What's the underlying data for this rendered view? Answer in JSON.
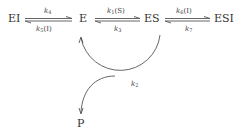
{
  "diagram": {
    "type": "enzyme kinetic scheme",
    "species": {
      "ei": "EI",
      "e": "E",
      "es": "ES",
      "esi": "ESI",
      "p": "P"
    },
    "rates": {
      "ei_e_forward": {
        "k": "k",
        "sub": "4",
        "arg": ""
      },
      "ei_e_reverse": {
        "k": "k",
        "sub": "5",
        "arg": "(I)"
      },
      "e_es_forward": {
        "k": "k",
        "sub": "1",
        "arg": "(S)"
      },
      "e_es_reverse": {
        "k": "k",
        "sub": "3",
        "arg": ""
      },
      "es_esi_forward": {
        "k": "k",
        "sub": "6",
        "arg": "(I)"
      },
      "es_esi_reverse": {
        "k": "k",
        "sub": "7",
        "arg": ""
      },
      "catalytic": {
        "k": "k",
        "sub": "2",
        "arg": ""
      }
    },
    "edges": [
      {
        "from": "EI",
        "to": "E",
        "type": "reversible",
        "forward": "k4",
        "reverse": "k5(I)"
      },
      {
        "from": "E",
        "to": "ES",
        "type": "reversible",
        "forward": "k1(S)",
        "reverse": "k3"
      },
      {
        "from": "ES",
        "to": "ESI",
        "type": "reversible",
        "forward": "k6(I)",
        "reverse": "k7"
      },
      {
        "from": "ES",
        "to": "E",
        "type": "curved",
        "label": "k2",
        "branch": "P"
      }
    ],
    "colors": {
      "line": "#555555",
      "text": "#333333",
      "background": "#ffffff"
    }
  }
}
